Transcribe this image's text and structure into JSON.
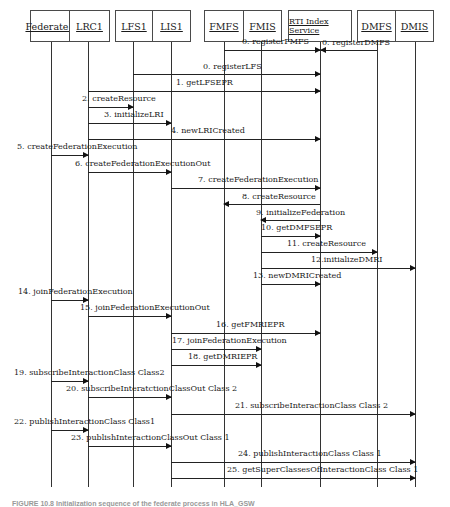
{
  "diagram": {
    "type": "sequence",
    "participants": [
      {
        "id": "federate1",
        "label": "Federate1",
        "x": 51
      },
      {
        "id": "lrc1",
        "label": "LRC1",
        "x": 88
      },
      {
        "id": "lfs1",
        "label": "LFS1",
        "x": 133
      },
      {
        "id": "lis1",
        "label": "LIS1",
        "x": 171
      },
      {
        "id": "fmfs",
        "label": "FMFS",
        "x": 224
      },
      {
        "id": "fmis",
        "label": "FMIS",
        "x": 261
      },
      {
        "id": "rti",
        "label": "RTI Index Service",
        "x": 320
      },
      {
        "id": "dmfs",
        "label": "DMFS",
        "x": 377
      },
      {
        "id": "dmis",
        "label": "DMIS",
        "x": 415
      }
    ],
    "messages": [
      {
        "label": "0. registerFMFS",
        "from": "fmfs",
        "to": "rti",
        "y": 50
      },
      {
        "label": "0. registerDMFS",
        "from": "dmfs",
        "to": "rti",
        "y": 50
      },
      {
        "label": "0. registerLFS",
        "from": "lfs1",
        "to": "rti",
        "y": 74
      },
      {
        "label": "1. getLFSEPR",
        "from": "lrc1",
        "to": "rti",
        "y": 91
      },
      {
        "label": "2. createResource",
        "from": "lrc1",
        "to": "lfs1",
        "y": 107
      },
      {
        "label": "3. initializeLRI",
        "from": "lrc1",
        "to": "lis1",
        "y": 123
      },
      {
        "label": "4. newLRICreated",
        "from": "lrc1",
        "to": "rti",
        "y": 139
      },
      {
        "label": "5. createFederationExecution",
        "from": "federate1",
        "to": "lrc1",
        "y": 155
      },
      {
        "label": "6. createFederationExecutionOut",
        "from": "lrc1",
        "to": "lis1",
        "y": 172
      },
      {
        "label": "7. createFederationExecution",
        "from": "lis1",
        "to": "rti",
        "y": 188
      },
      {
        "label": "8. createResource",
        "from": "rti",
        "to": "fmfs",
        "y": 204
      },
      {
        "label": "9. initializeFederation",
        "from": "rti",
        "to": "fmis",
        "y": 220
      },
      {
        "label": "10. getDMFSEPR",
        "from": "fmis",
        "to": "rti",
        "y": 236
      },
      {
        "label": "11. createResource",
        "from": "fmis",
        "to": "dmfs",
        "y": 252
      },
      {
        "label": "12.initializeDMRI",
        "from": "fmis",
        "to": "dmis",
        "y": 268
      },
      {
        "label": "13. newDMRICreated",
        "from": "fmis",
        "to": "rti",
        "y": 284
      },
      {
        "label": "14. joinFederationExecution",
        "from": "federate1",
        "to": "lrc1",
        "y": 300
      },
      {
        "label": "15. joinFederationExecutionOut",
        "from": "lrc1",
        "to": "lis1",
        "y": 316
      },
      {
        "label": "16. getFMRIEPR",
        "from": "lis1",
        "to": "rti",
        "y": 333
      },
      {
        "label": "17. joinFederationExecution",
        "from": "lis1",
        "to": "fmis",
        "y": 349
      },
      {
        "label": "18. getDMRIEPR",
        "from": "lis1",
        "to": "fmis",
        "y": 365
      },
      {
        "label": "19. subscribeInteractionClass Class2",
        "from": "federate1",
        "to": "lrc1",
        "y": 381
      },
      {
        "label": "20. subscribeInteratctionClassOut Class 2",
        "from": "lrc1",
        "to": "lis1",
        "y": 397
      },
      {
        "label": "21. subscribeInteractionClass Class 2",
        "from": "lis1",
        "to": "dmis",
        "y": 414
      },
      {
        "label": "22. publishInteractionClass Class1",
        "from": "federate1",
        "to": "lrc1",
        "y": 430
      },
      {
        "label": "23. publishInteractionClassOut Class 1",
        "from": "lrc1",
        "to": "lis1",
        "y": 446
      },
      {
        "label": "24. publishInteractionClass Class 1",
        "from": "lis1",
        "to": "dmis",
        "y": 462
      },
      {
        "label": "25. getSuperClassesOfInteractionClass Class 1",
        "from": "lis1",
        "to": "dmis",
        "y": 478
      }
    ],
    "caption": "FIGURE 10.8  Initialization sequence of the federate process in HLA_GSW"
  }
}
